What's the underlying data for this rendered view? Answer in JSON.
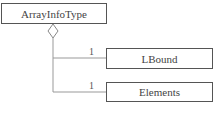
{
  "diagram": {
    "type": "UML class composition/aggregation",
    "parent": {
      "name": "ArrayInfoType"
    },
    "children": [
      {
        "name": "LBound",
        "multiplicity": "1"
      },
      {
        "name": "Elements",
        "multiplicity": "1"
      }
    ],
    "relationship": {
      "kind": "aggregation",
      "marker": "hollow-diamond"
    },
    "colors": {
      "line": "#999999",
      "border": "#555555",
      "text": "#444444",
      "background": "#ffffff"
    }
  }
}
